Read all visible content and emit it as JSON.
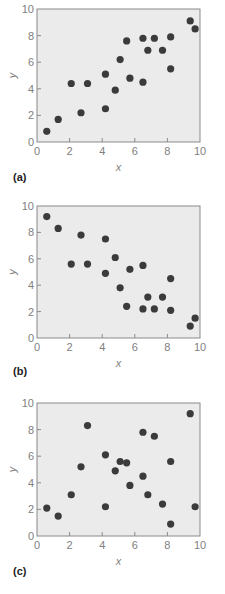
{
  "chart_data": [
    {
      "type": "scatter",
      "panel": "(a)",
      "title": "",
      "xlabel": "x",
      "ylabel": "y",
      "xlim": [
        0,
        10
      ],
      "ylim": [
        0,
        10
      ],
      "xticks": [
        0,
        2,
        4,
        6,
        8,
        10
      ],
      "yticks": [
        0,
        2,
        4,
        6,
        8,
        10
      ],
      "grid": false,
      "legend": null,
      "points": [
        {
          "x": 0.6,
          "y": 0.8
        },
        {
          "x": 1.3,
          "y": 1.7
        },
        {
          "x": 2.1,
          "y": 4.4
        },
        {
          "x": 2.7,
          "y": 2.2
        },
        {
          "x": 3.1,
          "y": 4.4
        },
        {
          "x": 4.2,
          "y": 5.1
        },
        {
          "x": 4.2,
          "y": 2.5
        },
        {
          "x": 4.8,
          "y": 3.9
        },
        {
          "x": 5.1,
          "y": 6.2
        },
        {
          "x": 5.5,
          "y": 7.6
        },
        {
          "x": 5.7,
          "y": 4.8
        },
        {
          "x": 6.5,
          "y": 7.8
        },
        {
          "x": 6.5,
          "y": 4.5
        },
        {
          "x": 6.8,
          "y": 6.9
        },
        {
          "x": 7.2,
          "y": 7.8
        },
        {
          "x": 7.7,
          "y": 6.9
        },
        {
          "x": 8.2,
          "y": 7.9
        },
        {
          "x": 8.2,
          "y": 5.5
        },
        {
          "x": 9.4,
          "y": 9.1
        },
        {
          "x": 9.7,
          "y": 8.5
        }
      ]
    },
    {
      "type": "scatter",
      "panel": "(b)",
      "title": "",
      "xlabel": "x",
      "ylabel": "y",
      "xlim": [
        0,
        10
      ],
      "ylim": [
        0,
        10
      ],
      "xticks": [
        0,
        2,
        4,
        6,
        8,
        10
      ],
      "yticks": [
        0,
        2,
        4,
        6,
        8,
        10
      ],
      "grid": false,
      "legend": null,
      "points": [
        {
          "x": 0.6,
          "y": 9.2
        },
        {
          "x": 1.3,
          "y": 8.3
        },
        {
          "x": 2.1,
          "y": 5.6
        },
        {
          "x": 2.7,
          "y": 7.8
        },
        {
          "x": 3.1,
          "y": 5.6
        },
        {
          "x": 4.2,
          "y": 7.5
        },
        {
          "x": 4.2,
          "y": 4.9
        },
        {
          "x": 4.8,
          "y": 6.1
        },
        {
          "x": 5.1,
          "y": 3.8
        },
        {
          "x": 5.5,
          "y": 2.4
        },
        {
          "x": 5.7,
          "y": 5.2
        },
        {
          "x": 6.5,
          "y": 5.5
        },
        {
          "x": 6.5,
          "y": 2.2
        },
        {
          "x": 6.8,
          "y": 3.1
        },
        {
          "x": 7.2,
          "y": 2.2
        },
        {
          "x": 7.7,
          "y": 3.1
        },
        {
          "x": 8.2,
          "y": 4.5
        },
        {
          "x": 8.2,
          "y": 2.1
        },
        {
          "x": 9.4,
          "y": 0.9
        },
        {
          "x": 9.7,
          "y": 1.5
        }
      ]
    },
    {
      "type": "scatter",
      "panel": "(c)",
      "title": "",
      "xlabel": "x",
      "ylabel": "y",
      "xlim": [
        0,
        10
      ],
      "ylim": [
        0,
        10
      ],
      "xticks": [
        0,
        2,
        4,
        6,
        8,
        10
      ],
      "yticks": [
        0,
        2,
        4,
        6,
        8,
        10
      ],
      "grid": false,
      "legend": null,
      "points": [
        {
          "x": 0.6,
          "y": 2.1
        },
        {
          "x": 1.3,
          "y": 1.5
        },
        {
          "x": 2.1,
          "y": 3.1
        },
        {
          "x": 2.7,
          "y": 5.2
        },
        {
          "x": 3.1,
          "y": 8.3
        },
        {
          "x": 4.2,
          "y": 6.1
        },
        {
          "x": 4.2,
          "y": 2.2
        },
        {
          "x": 4.8,
          "y": 4.9
        },
        {
          "x": 5.1,
          "y": 5.6
        },
        {
          "x": 5.5,
          "y": 5.5
        },
        {
          "x": 5.7,
          "y": 3.8
        },
        {
          "x": 6.5,
          "y": 7.8
        },
        {
          "x": 6.5,
          "y": 4.5
        },
        {
          "x": 6.8,
          "y": 3.1
        },
        {
          "x": 7.2,
          "y": 7.5
        },
        {
          "x": 7.7,
          "y": 2.4
        },
        {
          "x": 8.2,
          "y": 5.6
        },
        {
          "x": 8.2,
          "y": 0.9
        },
        {
          "x": 9.4,
          "y": 9.2
        },
        {
          "x": 9.7,
          "y": 2.2
        }
      ]
    }
  ],
  "colors": {
    "plot_background": "#ebebeb",
    "frame": "#8a8a8a",
    "marker": "#3b3b3b",
    "axis_text": "#808080",
    "panel_label": "#222222"
  },
  "panels": [
    {
      "label": "(a)"
    },
    {
      "label": "(b)"
    },
    {
      "label": "(c)"
    }
  ]
}
